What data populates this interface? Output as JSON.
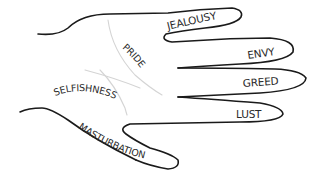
{
  "diagram": {
    "fingers": [
      {
        "id": "index",
        "label": "JEALOUSY"
      },
      {
        "id": "middle",
        "label": "ENVY"
      },
      {
        "id": "ring",
        "label": "GREED"
      },
      {
        "id": "pinky",
        "label": "LUST"
      },
      {
        "id": "thumb",
        "label": "MASTURBATION"
      }
    ],
    "palm_lines": [
      {
        "id": "upper",
        "label": "PRIDE"
      },
      {
        "id": "lower",
        "label": "SELFISHNESS"
      }
    ]
  }
}
